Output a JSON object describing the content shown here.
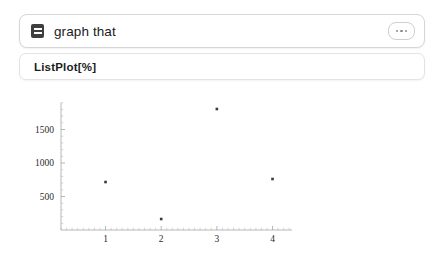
{
  "input": {
    "icon": "list-lines-icon",
    "text": "graph that",
    "menu_icon": "ellipsis-icon"
  },
  "output": {
    "code": "ListPlot[%]"
  },
  "chart_data": {
    "type": "scatter",
    "title": "",
    "xlabel": "",
    "ylabel": "",
    "x": [
      1,
      2,
      3,
      4
    ],
    "values": [
      716,
      164,
      1806,
      761
    ],
    "xtick_labels": [
      "1",
      "2",
      "3",
      "4"
    ],
    "xticks": [
      1,
      2,
      3,
      4
    ],
    "ytick_labels": [
      "500",
      "1000",
      "1500"
    ],
    "yticks": [
      500,
      1000,
      1500
    ],
    "xlim": [
      0.2,
      4.35
    ],
    "ylim": [
      0,
      1900
    ],
    "grid": false,
    "legend": "none",
    "marker": "square",
    "marker_color": "#3a3a3a"
  }
}
